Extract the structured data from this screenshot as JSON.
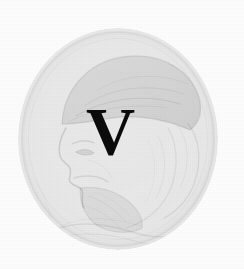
{
  "page": {
    "kind": "scanned-book-page",
    "width": 244,
    "height": 269,
    "background_color": "#fdfdfd",
    "ink_color": "#0b0b0b"
  },
  "dropcap": {
    "letter": "V",
    "description": "large bold serif initial capital",
    "color": "#0b0b0b"
  },
  "medallion": {
    "name": "portrait-medallion",
    "shape": "circle",
    "description": "faint halftone engraving of a bearded man in profile facing left, wearing a soft cap or turban",
    "tone_color": "#d6d6d6",
    "rim_color": "#c9c9c9",
    "center_x": 118,
    "center_y": 139,
    "radius_x": 100,
    "radius_y": 111
  },
  "figure": {
    "headwear": "soft draped cap",
    "parts": [
      "cap",
      "forehead",
      "eye",
      "nose",
      "moustache",
      "beard",
      "hair",
      "shoulder drapery"
    ]
  },
  "texture": {
    "name": "halftone-dither",
    "pattern": "fine screened dot grid from scan",
    "dot_pitch_px": 2
  }
}
